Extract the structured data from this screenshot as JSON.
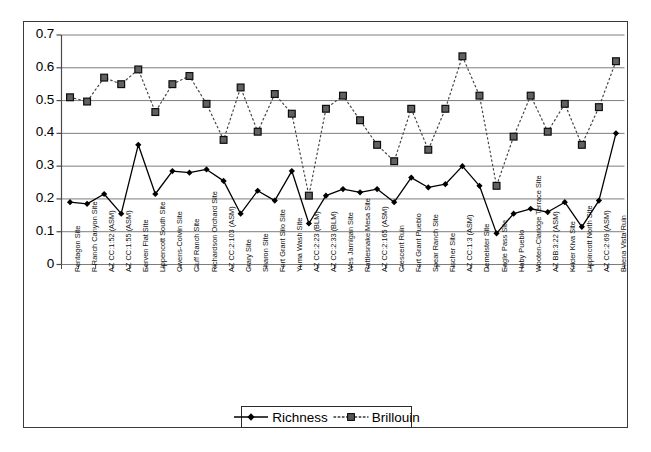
{
  "chart_data": {
    "type": "line",
    "title": "",
    "xlabel": "",
    "ylabel": "",
    "ylim": [
      0,
      0.7
    ],
    "yticks": [
      "0",
      "0.1",
      "0.2",
      "0.3",
      "0.4",
      "0.5",
      "0.6",
      "0.7"
    ],
    "ytick_values": [
      0,
      0.1,
      0.2,
      0.3,
      0.4,
      0.5,
      0.6,
      0.7
    ],
    "grid": true,
    "legend_position": "bottom-center",
    "categories": [
      "Pentagon Site",
      "P Ranch Canyon Site",
      "AZ CC:1:52 (ASM)",
      "AZ CC:1:55 (ASM)",
      "Eerven Flat Site",
      "Lippencott South Site",
      "Owens-Colvin Site",
      "Cluff Ranch Site",
      "Richardson Orchard Site",
      "AZ CC:2:103 (ASM)",
      "Crary Site",
      "Sharon Site",
      "Fort Grant Silo Site",
      "Yuma Wash Site",
      "AZ CC:2:23 (BLM)",
      "AZ CC:2:33 (BLM)",
      "Wes Jarnigan Site",
      "Rattlesnake Mesa Site",
      "AZ CC:2:165 (ASM)",
      "Crescent Ruin",
      "Fort Grant Pueblo",
      "Spear Ranch Site",
      "Fischer Site",
      "AZ CC:1:3 (ASM)",
      "Demeister Site",
      "Eagle Pass Site",
      "Haby Pueblo",
      "Wooten-Claridge Terrace Site",
      "AZ BB:3:22 (ASM)",
      "Krider Kiva Site",
      "Lippincott North Site",
      "AZ CC:2:69 (ASM)",
      "Buena Vista Ruin"
    ],
    "series": [
      {
        "name": "Richness",
        "marker": "diamond",
        "linestyle": "solid",
        "color": "#000000",
        "values": [
          0.19,
          0.185,
          0.215,
          0.155,
          0.365,
          0.215,
          0.285,
          0.28,
          0.29,
          0.255,
          0.155,
          0.225,
          0.195,
          0.285,
          0.125,
          0.21,
          0.23,
          0.22,
          0.23,
          0.19,
          0.265,
          0.235,
          0.245,
          0.3,
          0.24,
          0.095,
          0.155,
          0.17,
          0.16,
          0.19,
          0.115,
          0.195,
          0.4
        ]
      },
      {
        "name": "Brillouin",
        "marker": "square",
        "linestyle": "dotted",
        "color": "#444444",
        "values": [
          0.51,
          0.497,
          0.57,
          0.55,
          0.595,
          0.465,
          0.55,
          0.575,
          0.49,
          0.38,
          0.54,
          0.405,
          0.52,
          0.46,
          0.21,
          0.475,
          0.515,
          0.44,
          0.365,
          0.315,
          0.475,
          0.35,
          0.475,
          0.635,
          0.515,
          0.24,
          0.39,
          0.515,
          0.405,
          0.49,
          0.365,
          0.48,
          0.62
        ]
      }
    ]
  },
  "legend": {
    "items": [
      {
        "label": "Richness",
        "marker": "diamond",
        "linestyle": "solid"
      },
      {
        "label": "Brillouin",
        "marker": "square",
        "linestyle": "dotted"
      }
    ]
  }
}
